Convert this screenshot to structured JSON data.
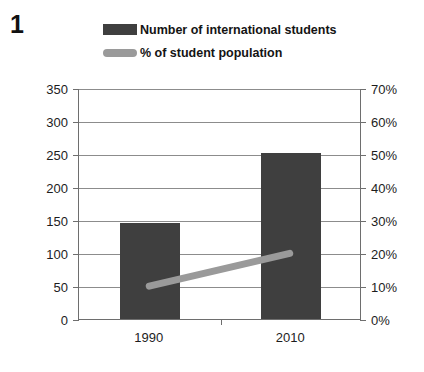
{
  "figure": {
    "number": "1"
  },
  "legend": {
    "position": "top",
    "entries": [
      {
        "label": "Number of international students",
        "swatch": "bar-swatch",
        "color": "#3f3f3f"
      },
      {
        "label": "% of student population",
        "swatch": "line-swatch",
        "color": "#9a9a9a"
      }
    ]
  },
  "chart_data": {
    "type": "bar",
    "title": "",
    "subtitle": "",
    "xlabel": "",
    "ylabel": "",
    "categories": [
      "1990",
      "2010"
    ],
    "grid": true,
    "legend_position": "top",
    "series": [
      {
        "name": "Number of international students",
        "type": "bar",
        "axis": "left",
        "color": "#3f3f3f",
        "values": [
          145,
          252
        ]
      },
      {
        "name": "% of student population",
        "type": "line",
        "axis": "right",
        "color": "#9a9a9a",
        "values": [
          10,
          20
        ]
      }
    ],
    "axes": {
      "left": {
        "ylim": [
          0,
          350
        ],
        "step": 50,
        "ticks": [
          "0",
          "50",
          "100",
          "150",
          "200",
          "250",
          "300",
          "350"
        ]
      },
      "right": {
        "ylim": [
          0,
          70
        ],
        "step": 10,
        "suffix": "%",
        "ticks": [
          "0%",
          "10%",
          "20%",
          "30%",
          "40%",
          "50%",
          "60%",
          "70%"
        ]
      },
      "x": {
        "ticks": [
          "1990",
          "2010"
        ]
      }
    }
  },
  "colors": {
    "bar": "#3f3f3f",
    "line": "#9a9a9a",
    "grid": "#8c8c8c",
    "axis": "#6e6e6e",
    "text": "#1d1d1d",
    "background": "#ffffff"
  }
}
